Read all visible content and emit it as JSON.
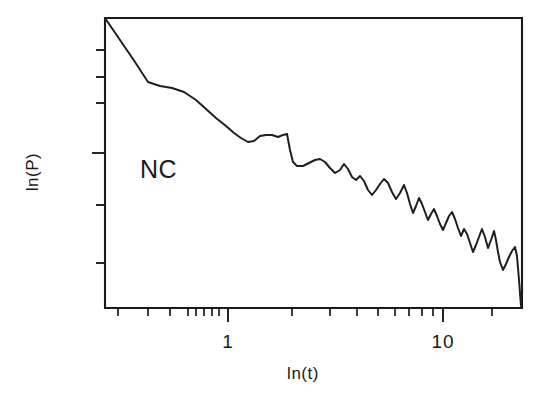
{
  "figure": {
    "background_color": "#ffffff",
    "ink_color": "#1a1a1a"
  },
  "chart_data": {
    "type": "line",
    "title": "",
    "subtitle": "",
    "xlabel": "ln(t)",
    "ylabel": "ln(P)",
    "xscale": "log",
    "yscale": "linear",
    "grid": false,
    "legend": null,
    "annotations": [
      {
        "text": "NC",
        "x_px": 140,
        "y_px": 178,
        "description": "series identifier inside plot area"
      }
    ],
    "x_tick_labels": [
      "1",
      "10"
    ],
    "x_tick_label_positions_px": [
      228,
      443
    ],
    "x_major_ticks": [
      1,
      10
    ],
    "x_minor_ticks": [
      0.3,
      0.4,
      0.5,
      0.6,
      0.7,
      0.8,
      0.9,
      2,
      3,
      4,
      5,
      6,
      7,
      8,
      9,
      20
    ],
    "y_tick_labels": [],
    "y_tick_count": 6,
    "y_axis_ticks_unlabeled": true,
    "xlim": [
      0.26,
      27
    ],
    "ylim": [
      0,
      1
    ],
    "series": [
      {
        "name": "NC",
        "color": "#1f1f1f",
        "description": "power spectrum, log-log, decaying with increasing jaggedness at large t",
        "points_px": [
          [
            105,
            18
          ],
          [
            120,
            40
          ],
          [
            135,
            62
          ],
          [
            148,
            82
          ],
          [
            160,
            86
          ],
          [
            172,
            88
          ],
          [
            184,
            92
          ],
          [
            196,
            100
          ],
          [
            206,
            109
          ],
          [
            216,
            118
          ],
          [
            226,
            126
          ],
          [
            234,
            133
          ],
          [
            241,
            138
          ],
          [
            248,
            142
          ],
          [
            254,
            141
          ],
          [
            260,
            136
          ],
          [
            266,
            135
          ],
          [
            272,
            135
          ],
          [
            278,
            137
          ],
          [
            283,
            135
          ],
          [
            287,
            134
          ],
          [
            290,
            150
          ],
          [
            293,
            162
          ],
          [
            297,
            166
          ],
          [
            303,
            166
          ],
          [
            309,
            163
          ],
          [
            315,
            160
          ],
          [
            320,
            159
          ],
          [
            325,
            162
          ],
          [
            330,
            168
          ],
          [
            335,
            173
          ],
          [
            340,
            170
          ],
          [
            344,
            164
          ],
          [
            348,
            169
          ],
          [
            352,
            177
          ],
          [
            356,
            180
          ],
          [
            360,
            176
          ],
          [
            364,
            181
          ],
          [
            368,
            190
          ],
          [
            372,
            195
          ],
          [
            376,
            190
          ],
          [
            380,
            184
          ],
          [
            384,
            179
          ],
          [
            388,
            183
          ],
          [
            392,
            192
          ],
          [
            396,
            199
          ],
          [
            400,
            193
          ],
          [
            404,
            185
          ],
          [
            407,
            193
          ],
          [
            410,
            204
          ],
          [
            413,
            213
          ],
          [
            416,
            206
          ],
          [
            419,
            198
          ],
          [
            422,
            204
          ],
          [
            425,
            212
          ],
          [
            428,
            220
          ],
          [
            431,
            214
          ],
          [
            434,
            209
          ],
          [
            437,
            216
          ],
          [
            440,
            224
          ],
          [
            443,
            230
          ],
          [
            446,
            223
          ],
          [
            449,
            216
          ],
          [
            452,
            212
          ],
          [
            455,
            219
          ],
          [
            458,
            228
          ],
          [
            461,
            236
          ],
          [
            464,
            229
          ],
          [
            467,
            234
          ],
          [
            470,
            243
          ],
          [
            473,
            252
          ],
          [
            476,
            245
          ],
          [
            479,
            237
          ],
          [
            482,
            229
          ],
          [
            485,
            237
          ],
          [
            488,
            248
          ],
          [
            491,
            240
          ],
          [
            494,
            231
          ],
          [
            496,
            240
          ],
          [
            498,
            252
          ],
          [
            500,
            262
          ],
          [
            503,
            270
          ],
          [
            506,
            264
          ],
          [
            509,
            257
          ],
          [
            512,
            251
          ],
          [
            515,
            247
          ],
          [
            517,
            256
          ],
          [
            519,
            280
          ],
          [
            521,
            306
          ]
        ]
      }
    ]
  },
  "axes": {
    "plot_box_px": {
      "left": 105,
      "top": 18,
      "right": 522,
      "bottom": 308
    },
    "y_ticks_px": [
      50,
      77,
      103,
      153,
      205,
      263
    ],
    "y_tick_lengths_px": [
      9,
      9,
      9,
      13,
      9,
      9
    ],
    "x_major_ticks_px": [
      228,
      443
    ],
    "x_minor_ticks_px": [
      118,
      148,
      170,
      188,
      196,
      204,
      212,
      219,
      292,
      330,
      357,
      378,
      395,
      409,
      422,
      433,
      492
    ],
    "x_major_tick_length_px": 14,
    "x_minor_tick_length_px": 8
  }
}
